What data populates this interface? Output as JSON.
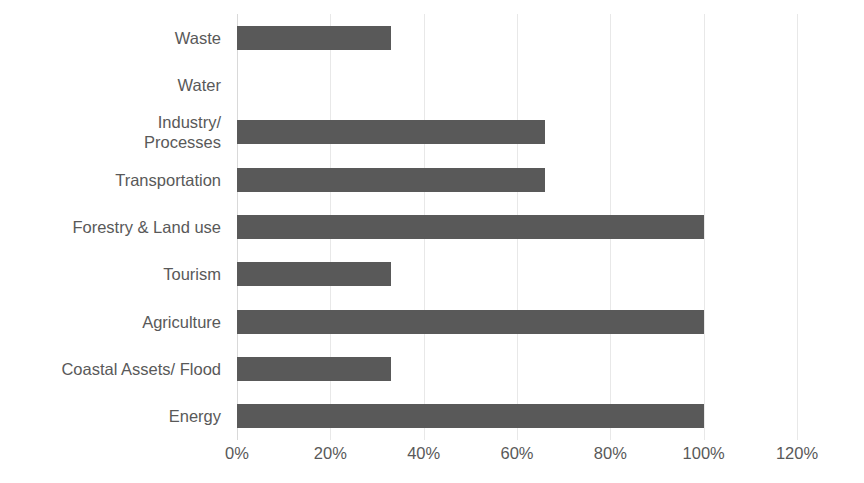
{
  "chart_data": {
    "type": "bar",
    "orientation": "horizontal",
    "title": "",
    "xlabel": "",
    "ylabel": "",
    "xlim": [
      0,
      120
    ],
    "grid": true,
    "legend": false,
    "bar_color": "#595959",
    "gridline_color": "#e8e8e8",
    "text_color": "#595959",
    "background": "#ffffff",
    "value_suffix": "%",
    "xticks": [
      0,
      20,
      40,
      60,
      80,
      100,
      120
    ],
    "xtick_labels": [
      "0%",
      "20%",
      "40%",
      "60%",
      "80%",
      "100%",
      "120%"
    ],
    "categories": [
      "Waste",
      "Water",
      "Industry/\nProcesses",
      "Transportation",
      "Forestry & Land use",
      "Tourism",
      "Agriculture",
      "Coastal Assets/ Flood",
      "Energy"
    ],
    "values": [
      33,
      0,
      66,
      66,
      100,
      33,
      100,
      33,
      100
    ]
  }
}
